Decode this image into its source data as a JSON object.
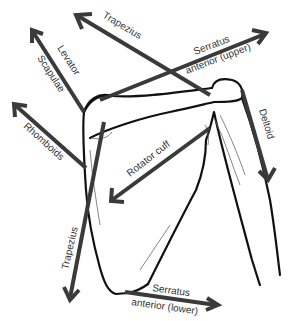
{
  "diagram": {
    "labels": {
      "trapezius_upper": "Trapezius",
      "levator_line1": "Levator",
      "levator_line2": "Scapulae",
      "rhomboids": "Rhomboids",
      "serratus_upper_line1": "Serratus",
      "serratus_upper_line2": "anterior (upper)",
      "deltoid": "Deltoid",
      "rotator_cuff": "Rotator cuff",
      "trapezius_lower": "Trapezius",
      "serratus_lower_line1": "Serratus",
      "serratus_lower_line2": "anterior (lower)"
    },
    "colors": {
      "arrow": "#3a3a3a",
      "bone_outline": "#111111",
      "background": "#ffffff"
    }
  }
}
